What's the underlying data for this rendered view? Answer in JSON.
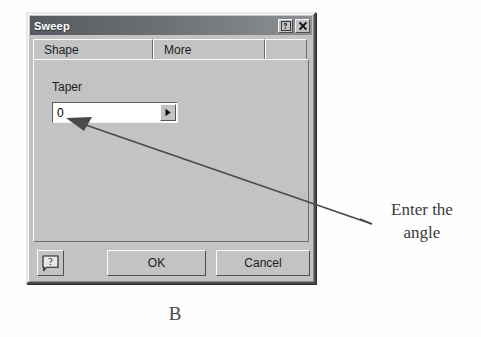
{
  "figure": {
    "caption": "B"
  },
  "annotation": {
    "line1": "Enter the",
    "line2": "angle",
    "full_text": "Enter the angle",
    "arrow": "arrow-pointing-to-taper-field"
  },
  "dialog": {
    "title": "Sweep",
    "titlebar_buttons": [
      {
        "name": "whats-this-help",
        "glyph": "?"
      },
      {
        "name": "close",
        "glyph": "X"
      }
    ],
    "tabs": [
      {
        "label": "Shape",
        "selected": false
      },
      {
        "label": "More",
        "selected": true
      },
      {
        "label": "",
        "selected": false
      }
    ],
    "fields": [
      {
        "label": "Taper",
        "value": "0",
        "placeholder": "0",
        "dropdown_glyph": "▶"
      }
    ],
    "buttons": {
      "help": "?",
      "ok": "OK",
      "cancel": "Cancel"
    }
  },
  "colors": {
    "dialog_face": "#c3c3c3",
    "titlebar_dark": "#555b60",
    "titlebar_light": "#8d9195",
    "field_background": "#ffffff",
    "text": "#1c1c1c",
    "annotation_text": "#3b3b3b",
    "page_background": "#ffffff"
  }
}
